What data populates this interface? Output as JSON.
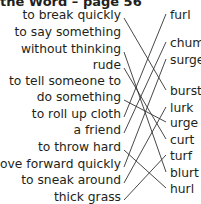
{
  "title": "the Word – page 56",
  "left_items": [
    {
      "label": "to break quickly",
      "y": 17
    },
    {
      "label": "to say something",
      "y": 34
    },
    {
      "label": "without thinking",
      "y": 51
    },
    {
      "label": "rude",
      "y": 67
    },
    {
      "label": "to tell someone to",
      "y": 83
    },
    {
      "label": "do something",
      "y": 99
    },
    {
      "label": "to roll up cloth",
      "y": 116
    },
    {
      "label": "a friend",
      "y": 132
    },
    {
      "label": "to throw hard",
      "y": 149
    },
    {
      "label": "move forward quickly",
      "y": 166
    },
    {
      "label": "to sneak around",
      "y": 182
    },
    {
      "label": "thick grass",
      "y": 199
    }
  ],
  "right_items": [
    {
      "label": "furl",
      "y": 17
    },
    {
      "label": "chum",
      "y": 45
    },
    {
      "label": "surge",
      "y": 62
    },
    {
      "label": "burst",
      "y": 93
    },
    {
      "label": "lurk",
      "y": 110
    },
    {
      "label": "urge",
      "y": 125
    },
    {
      "label": "curt",
      "y": 142
    },
    {
      "label": "turf",
      "y": 158
    },
    {
      "label": "blurt",
      "y": 175
    },
    {
      "label": "hurl",
      "y": 191
    }
  ],
  "matches": [
    {
      "from": "to break quickly",
      "to": "burst"
    },
    {
      "from": "without thinking",
      "to": "blurt"
    },
    {
      "from": "rude",
      "to": "curt"
    },
    {
      "from": "do something",
      "to": "urge"
    },
    {
      "from": "to roll up cloth",
      "to": "furl"
    },
    {
      "from": "a friend",
      "to": "chum"
    },
    {
      "from": "to throw hard",
      "to": "hurl"
    },
    {
      "from": "move forward quickly",
      "to": "surge"
    },
    {
      "from": "to sneak around",
      "to": "lurk"
    },
    {
      "from": "thick grass",
      "to": "turf"
    }
  ],
  "colors": {
    "text": "#231f20",
    "lines": "#333333"
  }
}
